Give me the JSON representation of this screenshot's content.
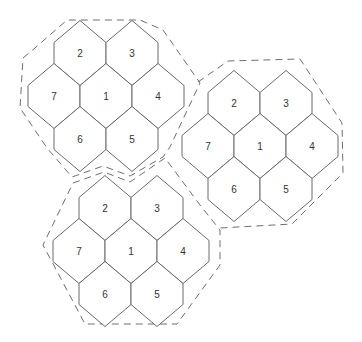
{
  "diagram": {
    "title": "",
    "colors": {
      "cell_stroke": "#6b6b6b",
      "boundary_stroke": "#6e6e6e",
      "label": "#333333",
      "background": "#ffffff"
    },
    "hex_geometry": {
      "half_width": 26,
      "slant_rise": 22,
      "half_side": 10.5,
      "col_step": 52,
      "row_step": 43
    },
    "cell_offsets": {
      "1": [
        0,
        0
      ],
      "2": [
        -26,
        -43
      ],
      "3": [
        26,
        -43
      ],
      "4": [
        52,
        0
      ],
      "5": [
        26,
        43
      ],
      "6": [
        -26,
        43
      ],
      "7": [
        -52,
        0
      ]
    },
    "clusters": [
      {
        "name": "cluster-top-left",
        "center": [
          106,
          96
        ],
        "cells": [
          "2",
          "3",
          "7",
          "1",
          "4",
          "6",
          "5"
        ],
        "boundary": [
          [
            23,
            58
          ],
          [
            35,
            48
          ],
          [
            67,
            20
          ],
          [
            140,
            20
          ],
          [
            163,
            30
          ],
          [
            200,
            83
          ],
          [
            170,
            147
          ],
          [
            163,
            157
          ],
          [
            130,
            176
          ],
          [
            103,
            166
          ],
          [
            72,
            177
          ],
          [
            47,
            148
          ],
          [
            20,
            108
          ],
          [
            23,
            58
          ]
        ]
      },
      {
        "name": "cluster-right",
        "center": [
          260,
          146
        ],
        "cells": [
          "2",
          "3",
          "7",
          "1",
          "4",
          "6",
          "5"
        ],
        "boundary": [
          [
            198,
            82
          ],
          [
            228,
            61
          ],
          [
            300,
            59
          ],
          [
            342,
            123
          ],
          [
            343,
            173
          ],
          [
            292,
            224
          ],
          [
            220,
            228
          ]
        ]
      },
      {
        "name": "cluster-bottom",
        "center": [
          131,
          251
        ],
        "cells": [
          "2",
          "3",
          "7",
          "1",
          "4",
          "6",
          "5"
        ],
        "boundary": [
          [
            73,
            183
          ],
          [
            104,
            172
          ],
          [
            130,
            182
          ],
          [
            165,
            158
          ],
          [
            200,
            205
          ],
          [
            220,
            230
          ],
          [
            220,
            265
          ],
          [
            177,
            324
          ],
          [
            85,
            324
          ],
          [
            43,
            245
          ],
          [
            73,
            183
          ]
        ]
      }
    ]
  }
}
